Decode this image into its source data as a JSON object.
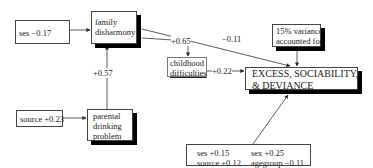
{
  "diagram": {
    "nodes": {
      "ses_input": {
        "label": "ses −0.17"
      },
      "family_disharmony": {
        "lines": [
          "family",
          "disharmony"
        ]
      },
      "childhood_difficulties": {
        "lines": [
          "childhood",
          "difficulties"
        ]
      },
      "variance": {
        "lines": [
          "15% variance",
          "accounted for"
        ]
      },
      "outcome": {
        "lines": [
          "EXCESS, SOCIABILITY,",
          "& DEVIANCE"
        ]
      },
      "source_input": {
        "label": "source +0.23"
      },
      "parental_drinking": {
        "lines": [
          "parental",
          "drinking",
          "problem"
        ]
      },
      "covariates": {
        "col1": [
          "ses +0.15",
          "source +0.12"
        ],
        "col2": [
          "sex +0.25",
          "agegroup −0.11"
        ]
      }
    },
    "edges": {
      "parental_to_family": "+0.57",
      "family_to_childhood": "+0.65",
      "family_to_outcome": "−0.11",
      "childhood_to_outcome": "+0.22"
    }
  }
}
